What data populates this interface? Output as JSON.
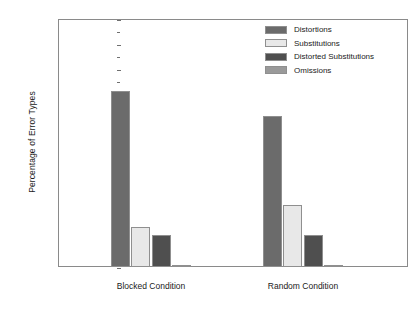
{
  "chart_data": {
    "type": "bar",
    "title": "",
    "xlabel": "",
    "ylabel": "Percentage of Error Types",
    "ylim": [
      0,
      100
    ],
    "ytick_step": 10,
    "yticks": [
      0,
      10,
      20,
      30,
      40,
      50,
      60,
      70,
      80,
      90,
      100
    ],
    "minor_ytick_step": 5,
    "grid": false,
    "legend_position": "top-right inside plot",
    "categories": [
      "Blocked Condition",
      "Random Condition"
    ],
    "series": [
      {
        "name": "Distortions",
        "values": [
          71,
          61
        ],
        "color": "#6b6b6b"
      },
      {
        "name": "Substitutions",
        "values": [
          16,
          25
        ],
        "color": "#e8e8e8"
      },
      {
        "name": "Distorted Substitutions",
        "values": [
          13,
          13
        ],
        "color": "#4f4f4f"
      },
      {
        "name": "Omissions",
        "values": [
          1,
          1
        ],
        "color": "#9a9a9a"
      }
    ]
  },
  "axis": {
    "y_title": "Percentage of Error Types",
    "y_tick_labels": [
      "100",
      "90",
      "80",
      "70",
      "60",
      "50",
      "40",
      "30",
      "20",
      "10",
      "0"
    ],
    "x_tick_labels": [
      "Blocked Condition",
      "Random Condition"
    ]
  },
  "legend": {
    "items": [
      {
        "label": "Distortions"
      },
      {
        "label": "Substitutions"
      },
      {
        "label": "Distorted Substitutions"
      },
      {
        "label": "Omissions"
      }
    ]
  }
}
